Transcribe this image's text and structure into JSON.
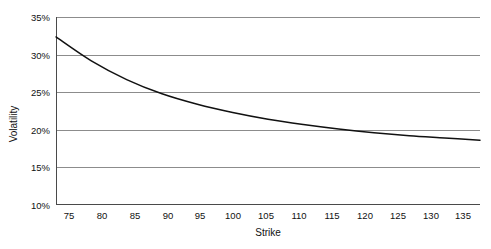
{
  "chart_data": {
    "type": "line",
    "title": "",
    "xlabel": "Strike",
    "ylabel": "Volatility",
    "xlim": [
      75,
      135
    ],
    "ylim": [
      10,
      35
    ],
    "grid": true,
    "legend": false,
    "x_ticks": [
      "75",
      "80",
      "85",
      "90",
      "95",
      "100",
      "105",
      "110",
      "115",
      "120",
      "125",
      "130",
      "135"
    ],
    "y_ticks": [
      "10%",
      "15%",
      "20%",
      "25%",
      "30%",
      "35%"
    ],
    "series": [
      {
        "name": "Implied Volatility Skew",
        "color": "#111111",
        "x": [
          75,
          80,
          85,
          90,
          95,
          100,
          105,
          110,
          115,
          120,
          125,
          130,
          135
        ],
        "values": [
          32.4,
          29.2,
          26.7,
          24.8,
          23.4,
          22.3,
          21.4,
          20.7,
          20.1,
          19.6,
          19.2,
          18.9,
          18.6
        ]
      }
    ]
  },
  "axes": {
    "y_title": "Volatility",
    "x_title": "Strike"
  }
}
